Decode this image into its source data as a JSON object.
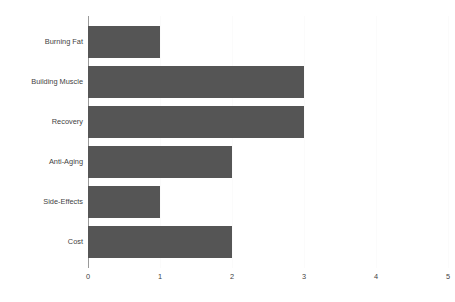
{
  "chart_data": {
    "type": "bar",
    "orientation": "horizontal",
    "title": "",
    "subtitle": "",
    "xlabel": "",
    "ylabel": "",
    "categories": [
      "Burning Fat",
      "Building Muscle",
      "Recovery",
      "Anti-Aging",
      "Side-Effects",
      "Cost"
    ],
    "values": [
      1,
      3,
      3,
      2,
      1,
      2
    ],
    "xlim": [
      0,
      5
    ],
    "xticks": [
      0,
      1,
      2,
      3,
      4,
      5
    ],
    "xtick_labels": [
      "0",
      "1",
      "2",
      "3",
      "4",
      "5"
    ],
    "grid": true,
    "grid_axis": "x",
    "legend": false,
    "legend_position": "none",
    "bar_color": "#555555",
    "axis_color": "#9a9a9a",
    "gridline_color": "#fbfbfb",
    "label_color": "#3f3f3f",
    "background_color": "#ffffff"
  }
}
